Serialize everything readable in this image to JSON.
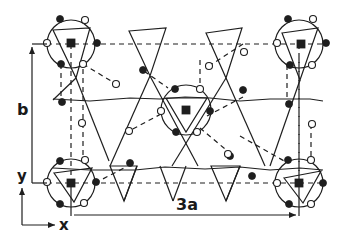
{
  "figure": {
    "type": "crystal-structure-projection",
    "labels": {
      "b_axis": "b",
      "a_axis": "3a",
      "y_axis": "y",
      "x_axis": "x"
    },
    "legend_symbols": {
      "filled_square": "cation site",
      "filled_circle": "atom (filled)",
      "open_circle": "atom (open)"
    },
    "colors": {
      "ink": "#1e1e1e",
      "background": "#ffffff"
    }
  }
}
